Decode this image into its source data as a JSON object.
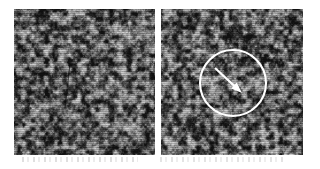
{
  "figure": {
    "kind": "image-pair",
    "background_color": "#ffffff",
    "width": 320,
    "height": 169,
    "caption_text": "",
    "title_text": ""
  },
  "panels": [
    {
      "id": "panel-left",
      "role": "reference-texture",
      "label": "",
      "x": 14,
      "y": 9,
      "width": 141,
      "height": 146,
      "texture": {
        "type": "grayscale-speckle",
        "seed": 20731,
        "blob_scale": 4.6,
        "octaves": 4,
        "contrast": 1.62,
        "brightness": -0.07,
        "mean_gray": "#4a4a4a",
        "light_gray": "#d2d2d2",
        "dark_gray": "#121212",
        "scanline_opacity": 0.17,
        "scanline_period": 2
      },
      "features": [
        {
          "kind": "dark-streak",
          "x1": 56,
          "y1": 55,
          "x2": 51,
          "y2": 99,
          "stroke_width": 1.3,
          "color": "#0d0d0d",
          "opacity": 0.62
        }
      ],
      "annotations": []
    },
    {
      "id": "panel-right",
      "role": "annotated-texture",
      "label": "",
      "x": 161,
      "y": 9,
      "width": 142,
      "height": 146,
      "texture": {
        "type": "grayscale-speckle",
        "seed": 59144,
        "blob_scale": 4.6,
        "octaves": 4,
        "contrast": 1.62,
        "brightness": -0.07,
        "mean_gray": "#4a4a4a",
        "light_gray": "#d2d2d2",
        "dark_gray": "#121212",
        "scanline_opacity": 0.17,
        "scanline_period": 2
      },
      "features": [],
      "annotations": [
        {
          "kind": "circle-marker",
          "center_x": 72,
          "center_y": 74,
          "radius": 33,
          "stroke_color": "#ffffff",
          "stroke_width": 2.1,
          "fill": "none"
        },
        {
          "kind": "arrow-marker",
          "x1": 54,
          "y1": 59,
          "x2": 81,
          "y2": 84,
          "stroke_color": "#ffffff",
          "stroke_width": 2.1,
          "head_length": 11,
          "head_width": 8,
          "direction": "down-right"
        }
      ]
    }
  ],
  "artifacts": [
    {
      "kind": "scan-smudge",
      "x": 22,
      "y": 157,
      "width": 116,
      "height": 5,
      "opacity": 0.17
    },
    {
      "kind": "scan-smudge",
      "x": 160,
      "y": 157,
      "width": 126,
      "height": 5,
      "opacity": 0.15
    }
  ]
}
